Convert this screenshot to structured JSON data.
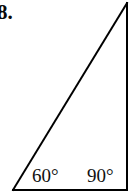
{
  "figure": {
    "problem_number": "8.",
    "type": "geometry-triangle-diagram",
    "background_color": "#ffffff",
    "stroke_color": "#000000",
    "stroke_width": 2,
    "triangle": {
      "name": "right-triangle",
      "vertices": [
        {
          "name": "bottom-left-vertex",
          "x": 13,
          "y": 190
        },
        {
          "name": "bottom-right-vertex",
          "x": 127,
          "y": 190
        },
        {
          "name": "top-right-apex",
          "x": 127,
          "y": 3
        }
      ],
      "edges": [
        {
          "name": "base-edge",
          "from": "bottom-left-vertex",
          "to": "bottom-right-vertex"
        },
        {
          "name": "vertical-edge",
          "from": "bottom-right-vertex",
          "to": "top-right-apex"
        },
        {
          "name": "hypotenuse-edge",
          "from": "bottom-left-vertex",
          "to": "top-right-apex"
        }
      ]
    },
    "angle_labels": [
      {
        "name": "left-angle",
        "text": "60°",
        "value": 60,
        "at_vertex": "bottom-left-vertex"
      },
      {
        "name": "right-angle",
        "text": "90°",
        "value": 90,
        "at_vertex": "bottom-right-vertex"
      }
    ]
  }
}
